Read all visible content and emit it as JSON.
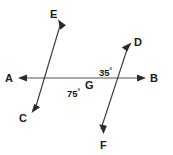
{
  "figure": {
    "type": "geometry-diagram",
    "background_color": "#ffffff",
    "line_color": "#3a3a3a",
    "label_color": "#1a1a1a"
  },
  "vertex": {
    "label": "G",
    "x": 81,
    "y": 78,
    "label_x": 85,
    "label_y": 89
  },
  "rays": [
    {
      "id": "ray-A",
      "label": "A",
      "direction": "left",
      "tip_x": 19,
      "tip_y": 78,
      "label_x": 5,
      "label_y": 82,
      "arrow": true
    },
    {
      "id": "ray-B",
      "label": "B",
      "direction": "right",
      "tip_x": 145,
      "tip_y": 78,
      "label_x": 150,
      "label_y": 82,
      "arrow": true
    },
    {
      "id": "ray-C",
      "label": "C",
      "direction": "lower-left",
      "tip_x": 32,
      "tip_y": 112,
      "label_x": 19,
      "label_y": 122,
      "arrow": true
    },
    {
      "id": "ray-D",
      "label": "D",
      "direction": "upper-right",
      "tip_x": 131,
      "tip_y": 43,
      "label_x": 134,
      "label_y": 46,
      "arrow": true
    },
    {
      "id": "ray-E",
      "label": "E",
      "direction": "upper-left-steep",
      "tip_x": 58,
      "tip_y": 20,
      "label_x": 50,
      "label_y": 18,
      "arrow": true
    },
    {
      "id": "ray-F",
      "label": "F",
      "direction": "lower-right-steep",
      "tip_x": 103,
      "tip_y": 133,
      "label_x": 100,
      "label_y": 149,
      "arrow": true
    }
  ],
  "angles": [
    {
      "id": "angle-DGB",
      "value": "35",
      "degree_symbol": "°",
      "between": "ray D and ray B",
      "label_x": 99,
      "label_y": 76
    },
    {
      "id": "angle-AGC",
      "value": "75",
      "degree_symbol": "°",
      "between": "ray A and ray C",
      "label_x": 67,
      "label_y": 97
    }
  ]
}
